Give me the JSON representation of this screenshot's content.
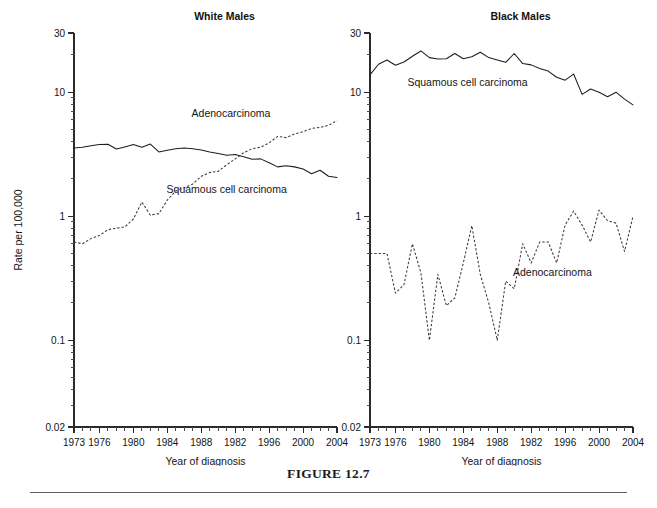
{
  "figure": {
    "caption": "FIGURE 12.7",
    "ylabel": "Rate per 100,000",
    "xlabel_left": "Year of diagnosis",
    "xlabel_right": "Year of diagnosis"
  },
  "chart_data": [
    {
      "type": "line",
      "title": "White Males",
      "xlabel": "Year of diagnosis",
      "ylabel": "Rate per 100,000",
      "yscale": "log",
      "ylim": [
        0.02,
        30
      ],
      "ytick_labels": [
        "30",
        "10",
        "1",
        "0.1",
        "0.02"
      ],
      "ytick_values": [
        30,
        10,
        1,
        0.1,
        0.02
      ],
      "xlim": [
        1973,
        2004
      ],
      "xtick_labels": [
        "1973",
        "1976",
        "1980",
        "1984",
        "1988",
        "1982",
        "1996",
        "2000",
        "2004"
      ],
      "xtick_values": [
        1973,
        1976,
        1980,
        1984,
        1988,
        1992,
        1996,
        2000,
        2004
      ],
      "grid": false,
      "legend_position": "inline-annotations",
      "annotations": [
        {
          "text": "Adenocarcinoma",
          "x": 1991.5,
          "y": 6.3
        },
        {
          "text": "Squamous cell carcinoma",
          "x": 1991.0,
          "y": 1.55
        }
      ],
      "x": [
        1973,
        1974,
        1975,
        1976,
        1977,
        1978,
        1979,
        1980,
        1981,
        1982,
        1983,
        1984,
        1985,
        1986,
        1987,
        1988,
        1989,
        1990,
        1991,
        1992,
        1993,
        1994,
        1995,
        1996,
        1997,
        1998,
        1999,
        2000,
        2001,
        2002,
        2003,
        2004
      ],
      "series": [
        {
          "name": "Squamous cell carcinoma",
          "style": "solid",
          "values": [
            3.55,
            3.6,
            3.7,
            3.78,
            3.8,
            3.48,
            3.62,
            3.78,
            3.6,
            3.82,
            3.3,
            3.4,
            3.5,
            3.55,
            3.5,
            3.42,
            3.3,
            3.2,
            3.1,
            3.15,
            3.02,
            2.88,
            2.9,
            2.7,
            2.5,
            2.55,
            2.5,
            2.4,
            2.2,
            2.35,
            2.1,
            2.05
          ]
        },
        {
          "name": "Adenocarcinoma",
          "style": "dashed",
          "values": [
            0.62,
            0.6,
            0.66,
            0.7,
            0.78,
            0.8,
            0.82,
            0.95,
            1.3,
            1.02,
            1.05,
            1.35,
            1.6,
            1.7,
            1.82,
            2.1,
            2.25,
            2.3,
            2.6,
            2.9,
            3.25,
            3.5,
            3.6,
            3.9,
            4.4,
            4.3,
            4.6,
            4.8,
            5.1,
            5.2,
            5.4,
            5.9
          ]
        }
      ]
    },
    {
      "type": "line",
      "title": "Black Males",
      "xlabel": "Year of diagnosis",
      "ylabel": "Rate per 100,000",
      "yscale": "log",
      "ylim": [
        0.02,
        30
      ],
      "ytick_labels": [
        "30",
        "10",
        "1",
        "0.1",
        "0.02"
      ],
      "ytick_values": [
        30,
        10,
        1,
        0.1,
        0.02
      ],
      "xlim": [
        1973,
        2004
      ],
      "xtick_labels": [
        "1973",
        "1976",
        "1980",
        "1984",
        "1988",
        "1982",
        "1996",
        "2000",
        "2004"
      ],
      "xtick_values": [
        1973,
        1976,
        1980,
        1984,
        1988,
        1992,
        1996,
        2000,
        2004
      ],
      "grid": false,
      "legend_position": "inline-annotations",
      "annotations": [
        {
          "text": "Squamous cell carcinoma",
          "x": 1984.5,
          "y": 11.2
        },
        {
          "text": "Adenocarcinoma",
          "x": 1994.5,
          "y": 0.33
        }
      ],
      "x": [
        1973,
        1974,
        1975,
        1976,
        1977,
        1978,
        1979,
        1980,
        1981,
        1982,
        1983,
        1984,
        1985,
        1986,
        1987,
        1988,
        1989,
        1990,
        1991,
        1992,
        1993,
        1994,
        1995,
        1996,
        1997,
        1998,
        1999,
        2000,
        2001,
        2002,
        2003,
        2004
      ],
      "series": [
        {
          "name": "Squamous cell carcinoma",
          "style": "solid",
          "values": [
            13.8,
            16.8,
            18.2,
            16.5,
            17.5,
            19.5,
            21.5,
            19.0,
            18.5,
            18.6,
            20.5,
            18.6,
            19.3,
            21.0,
            19.0,
            18.2,
            17.4,
            20.5,
            17.0,
            16.6,
            15.5,
            14.8,
            13.2,
            12.5,
            14.0,
            9.6,
            10.6,
            10.0,
            9.2,
            10.0,
            8.8,
            7.9
          ]
        },
        {
          "name": "Adenocarcinoma",
          "style": "dashed",
          "values": [
            0.5,
            0.5,
            0.5,
            0.24,
            0.28,
            0.6,
            0.35,
            0.1,
            0.34,
            0.19,
            0.22,
            0.42,
            0.84,
            0.34,
            0.2,
            0.1,
            0.3,
            0.26,
            0.6,
            0.42,
            0.62,
            0.62,
            0.42,
            0.85,
            1.1,
            0.85,
            0.62,
            1.12,
            0.92,
            0.88,
            0.52,
            1.0
          ]
        }
      ]
    }
  ]
}
